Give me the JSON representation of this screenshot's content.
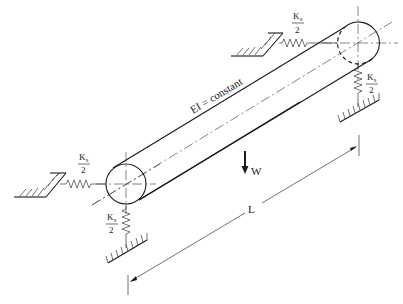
{
  "diagram": {
    "title": "",
    "beam_label": "EI = constant",
    "load_label": "W",
    "length_label": "L",
    "spring_label_numerator": "K",
    "spring_label_subscript": "s",
    "spring_label_denominator": "2",
    "springs": [
      {
        "id": "left-horizontal",
        "label": "Ks/2"
      },
      {
        "id": "left-vertical",
        "label": "Ks/2"
      },
      {
        "id": "right-horizontal",
        "label": "Ks/2"
      },
      {
        "id": "right-vertical",
        "label": "Ks/2"
      }
    ],
    "ends": {
      "left_center": [
        126,
        184
      ],
      "right_center": [
        358,
        43
      ],
      "radius": 20
    },
    "colors": {
      "stroke": "#1a1a1a",
      "background": "#ffffff"
    }
  }
}
